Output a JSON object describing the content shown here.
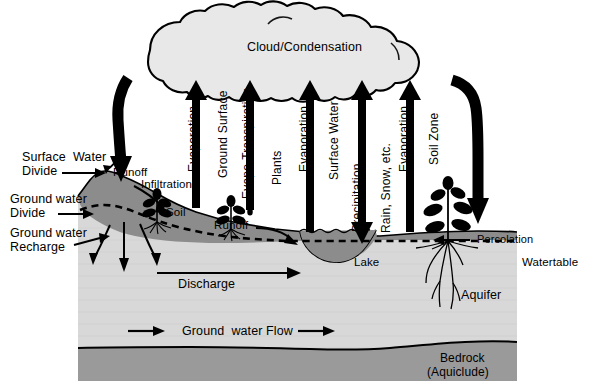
{
  "diagram": {
    "type": "cross-section schematic",
    "background_color": "#ffffff"
  },
  "colors": {
    "outline": "#000000",
    "cloud_fill": "#e8e8e8",
    "soil_fill": "#8c8c8c",
    "aquifer_fill": "#d8d8d8",
    "bedrock_fill": "#9a9a9a",
    "lake_fill": "#8c8c8c",
    "arrow_fill": "#000000",
    "text": "#000000"
  },
  "cloud": {
    "label": "Cloud/Condensation"
  },
  "flux_arrows": [
    {
      "id": "evaporation-ground-surface",
      "primary": "Evaporation",
      "secondary": "Ground Surface",
      "direction": "up"
    },
    {
      "id": "evapotranspiration-plants",
      "primary": "Evapo-Transpiration",
      "secondary": "Plants",
      "direction": "up"
    },
    {
      "id": "evaporation-surface-water",
      "primary": "Evaporation",
      "secondary": "Surface Water",
      "direction": "up"
    },
    {
      "id": "precipitation-rain-snow",
      "primary": "Precipitation",
      "secondary": "Rain, Snow, etc.",
      "direction": "both"
    },
    {
      "id": "evaporation-soil-zone",
      "primary": "Evaporation",
      "secondary": "Soil Zone",
      "direction": "up"
    }
  ],
  "left_labels": {
    "surface_water_divide": "Surface  Water\nDivide",
    "ground_water_divide": "Ground water\nDivide",
    "ground_water_recharge": "Ground water\nRecharge"
  },
  "surface_labels": {
    "runoff_left": "Runoff",
    "infiltration": "Infiltration",
    "soil": "Soil",
    "runoff_right": "Runoff",
    "percolation": "Percolation",
    "watertable": "Watertable"
  },
  "subsurface_labels": {
    "discharge": "Discharge",
    "ground_water_flow": "Ground  water Flow",
    "aquifer": "Aquifer",
    "lake": "Lake",
    "bedrock_line1": "Bedrock",
    "bedrock_line2": "(Aquiclude)"
  },
  "icons": {
    "cloud": "cloud-icon",
    "plant_small_left": "plant-icon",
    "plant_small_right": "plant-icon",
    "plant_large": "plant-with-roots-icon",
    "down_arrow_curved_left": "curved-down-arrow-icon",
    "down_arrow_curved_right": "curved-down-arrow-icon"
  }
}
